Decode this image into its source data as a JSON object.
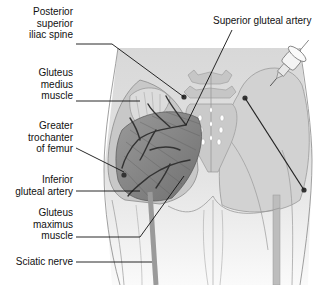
{
  "figure": {
    "labels_left": [
      {
        "id": "psis",
        "text": "Posterior\nsuperior\niliac spine"
      },
      {
        "id": "gluteus_medius",
        "text": "Gluteus\nmedius\nmuscle"
      },
      {
        "id": "greater_trochanter",
        "text": "Greater\ntrochanter\nof femur"
      },
      {
        "id": "inferior_gluteal_artery",
        "text": "Inferior\ngluteal artery"
      },
      {
        "id": "gluteus_maximus",
        "text": "Gluteus\nmaximus\nmuscle"
      },
      {
        "id": "sciatic_nerve",
        "text": "Sciatic nerve"
      }
    ],
    "labels_top": [
      {
        "id": "superior_gluteal_artery",
        "text": "Superior gluteal artery"
      }
    ],
    "icons": {
      "syringe": "syringe-icon"
    },
    "colors": {
      "background": "#ffffff",
      "skin": "#e6e6e6",
      "skin_shade": "#cfcfcf",
      "muscle": "#8a8a8a",
      "muscle_dark": "#6e6e6e",
      "vessel": "#3a3a3a",
      "bone": "#c9c9c9",
      "leader": "#111111"
    }
  }
}
